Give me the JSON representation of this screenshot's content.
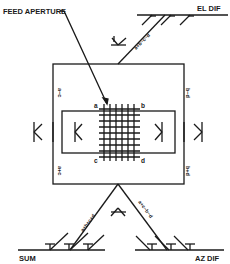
{
  "diagram": {
    "title_callout": "FEED APERTURE",
    "ports": {
      "el_dif": "EL DIF",
      "sum": "SUM",
      "az_dif": "AZ DIF"
    },
    "corner_labels": {
      "a": "a",
      "b": "b",
      "c": "c",
      "d": "d"
    },
    "arm_labels": {
      "top_left": "a−c",
      "top_right": "b−d",
      "bottom_left": "a+c",
      "bottom_right": "b+d"
    },
    "feed_lines": {
      "el_dif": "a+b−c−d",
      "sum": "a+b+c+d",
      "az_dif": "a+c−b−d"
    },
    "colors": {
      "line": "#1a1a1a",
      "background": "#ffffff"
    }
  }
}
